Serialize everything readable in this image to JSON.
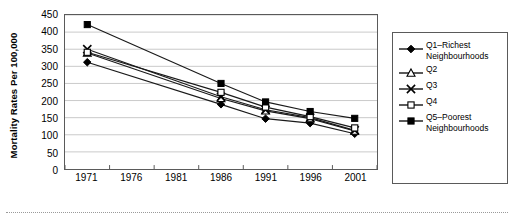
{
  "chart_data": {
    "type": "line",
    "title": "",
    "xlabel": "",
    "ylabel": "Mortality Rates Per 100,000",
    "categories": [
      "1971",
      "1976",
      "1981",
      "1986",
      "1991",
      "1996",
      "2001"
    ],
    "x_tick_labels": [
      "1971",
      "1976",
      "1981",
      "1986",
      "1991",
      "1996",
      "2001"
    ],
    "y_tick_labels": [
      "0",
      "50",
      "100",
      "150",
      "200",
      "250",
      "300",
      "350",
      "400",
      "450"
    ],
    "y_ticks": [
      0,
      50,
      100,
      150,
      200,
      250,
      300,
      350,
      400,
      450
    ],
    "ylim": [
      0,
      450
    ],
    "grid": "horizontal",
    "legend_position": "right",
    "marker_x_values": [
      "1971",
      "1986",
      "1991",
      "1996",
      "2001"
    ],
    "series": [
      {
        "name": "Q1–Richest Neighbourhoods",
        "legend_label": "Q1–Richest\nNeighbourhoods",
        "marker": "filled-diamond",
        "color": "#000000",
        "x": [
          "1971",
          "1986",
          "1991",
          "1996",
          "2001"
        ],
        "values": [
          312,
          189,
          147,
          134,
          103
        ]
      },
      {
        "name": "Q2",
        "legend_label": "Q2",
        "marker": "open-triangle",
        "color": "#000000",
        "x": [
          "1971",
          "1986",
          "1991",
          "1996",
          "2001"
        ],
        "values": [
          339,
          206,
          170,
          147,
          111
        ]
      },
      {
        "name": "Q3",
        "legend_label": "Q3",
        "marker": "x-cross",
        "color": "#000000",
        "x": [
          "1971",
          "1986",
          "1991",
          "1996",
          "2001"
        ],
        "values": [
          350,
          211,
          173,
          150,
          113
        ]
      },
      {
        "name": "Q4",
        "legend_label": "Q4",
        "marker": "open-square",
        "color": "#000000",
        "x": [
          "1971",
          "1986",
          "1991",
          "1996",
          "2001"
        ],
        "values": [
          341,
          224,
          181,
          153,
          120
        ]
      },
      {
        "name": "Q5–Poorest Neighbourhoods",
        "legend_label": "Q5–Poorest\nNeighbourhoods",
        "marker": "filled-square",
        "color": "#000000",
        "x": [
          "1971",
          "1986",
          "1991",
          "1996",
          "2001"
        ],
        "values": [
          422,
          250,
          196,
          168,
          148
        ]
      }
    ]
  },
  "style": {
    "axis_color": "#5a5a5a",
    "grid_color": "#c9c9c9",
    "line_color": "#1a1a1a",
    "background": "#ffffff"
  }
}
